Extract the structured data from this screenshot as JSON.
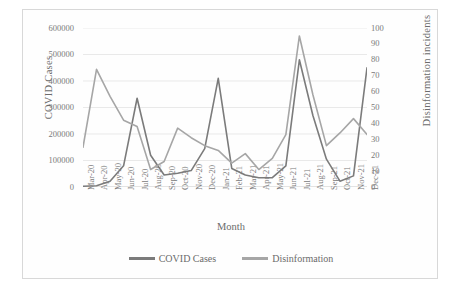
{
  "chart_data": {
    "type": "line",
    "title": "",
    "xlabel": "Month",
    "ylabel": "COVID Cases",
    "y2label": "Disinformation incidents",
    "grid": true,
    "legend_position": "bottom",
    "categories": [
      "Mar-20",
      "Apr-20",
      "May-20",
      "Jun-20",
      "Jul-20",
      "Aug-20",
      "Sep-20",
      "Oct-20",
      "Nov-20",
      "Dec-20",
      "Jan-21",
      "Feb-21",
      "Mar-21",
      "Apr-21",
      "May-21",
      "Jun-21",
      "Jul-21",
      "Aug-21",
      "Sep-21",
      "Oct-21",
      "Nov-21",
      "Dec-21"
    ],
    "ylim": [
      0,
      600000
    ],
    "yticks": [
      0,
      100000,
      200000,
      300000,
      400000,
      500000,
      600000
    ],
    "ytick_labels": [
      "0",
      "100000",
      "200000",
      "300000",
      "400000",
      "500000",
      "600000"
    ],
    "y2lim": [
      0,
      100
    ],
    "y2ticks": [
      0,
      10,
      20,
      30,
      40,
      50,
      60,
      70,
      80,
      90,
      100
    ],
    "y2tick_labels": [
      "0",
      "10",
      "20",
      "30",
      "40",
      "50",
      "60",
      "70",
      "80",
      "90",
      "100"
    ],
    "series": [
      {
        "name": "COVID Cases",
        "axis": "left",
        "color": "#7b7b7b",
        "values": [
          3000,
          5000,
          22000,
          80000,
          335000,
          120000,
          45000,
          52000,
          62000,
          145000,
          410000,
          70000,
          45000,
          35000,
          35000,
          80000,
          480000,
          270000,
          105000,
          22000,
          42000,
          450000
        ]
      },
      {
        "name": "Disinformation",
        "axis": "right",
        "color": "#a6a6a6",
        "values": [
          25,
          74,
          57,
          42,
          38,
          11,
          16,
          37,
          31,
          26,
          23,
          15,
          21,
          11,
          18,
          33,
          95,
          58,
          26,
          34,
          43,
          33
        ]
      }
    ]
  },
  "legend": {
    "items": [
      {
        "label": "COVID Cases",
        "color": "#7b7b7b"
      },
      {
        "label": "Disinformation",
        "color": "#a6a6a6"
      }
    ]
  }
}
